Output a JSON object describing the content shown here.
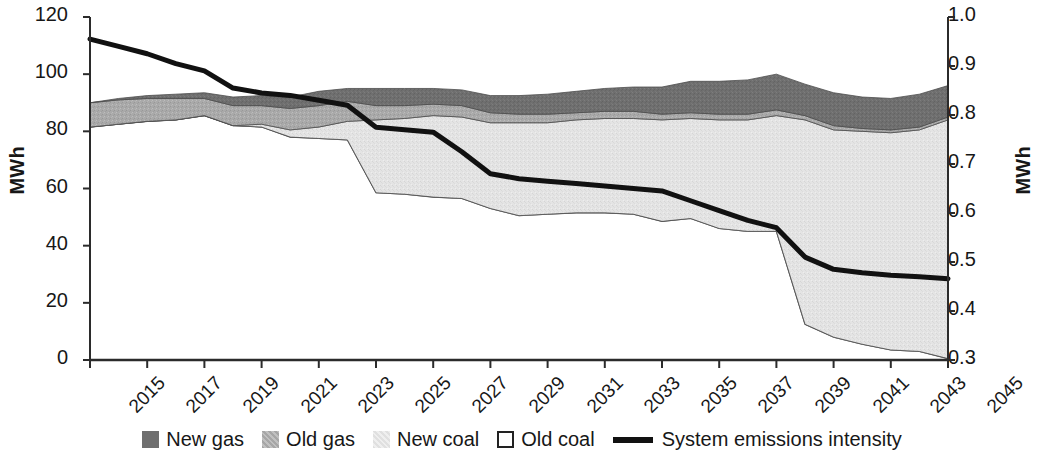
{
  "axes": {
    "left": {
      "label": "MWh",
      "ticks": [
        "0",
        "20",
        "40",
        "60",
        "80",
        "100",
        "120"
      ],
      "min": 0,
      "max": 120
    },
    "right": {
      "label": "MWh",
      "ticks": [
        "0.3",
        "0.4",
        "0.5",
        "0.6",
        "0.7",
        "0.8",
        "0.9",
        "1.0"
      ],
      "min": 0.3,
      "max": 1.0
    },
    "x": {
      "ticks": [
        "2015",
        "2017",
        "2019",
        "2021",
        "2023",
        "2025",
        "2027",
        "2029",
        "2031",
        "2033",
        "2035",
        "2037",
        "2039",
        "2041",
        "2043",
        "2045"
      ],
      "min": 2015,
      "max": 2045
    }
  },
  "legend": {
    "items": [
      {
        "label": "New gas",
        "swatch": "filled",
        "color": "#6f6f6f"
      },
      {
        "label": "Old gas",
        "swatch": "filled",
        "color": "#a8a8a8"
      },
      {
        "label": "New coal",
        "swatch": "filled",
        "color": "#e2e2e2"
      },
      {
        "label": "Old coal",
        "swatch": "outline",
        "color": "#ffffff"
      },
      {
        "label": "System emissions intensity",
        "swatch": "line",
        "color": "#111111"
      }
    ]
  },
  "chart_data": {
    "type": "area",
    "title": "",
    "xlabel": "",
    "ylabel": "MWh",
    "y2label": "MWh",
    "ylim": [
      0,
      120
    ],
    "y2lim": [
      0.3,
      1.0
    ],
    "grid": false,
    "legend_position": "bottom",
    "stacked": true,
    "stack_order": [
      "Old coal",
      "New coal",
      "Old gas",
      "New gas"
    ],
    "x": [
      2015,
      2016,
      2017,
      2018,
      2019,
      2020,
      2021,
      2022,
      2023,
      2024,
      2025,
      2026,
      2027,
      2028,
      2029,
      2030,
      2031,
      2032,
      2033,
      2034,
      2035,
      2036,
      2037,
      2038,
      2039,
      2040,
      2041,
      2042,
      2043,
      2044,
      2045
    ],
    "series": [
      {
        "name": "Old coal",
        "axis": "left",
        "color": "#ffffff",
        "values": [
          81.5,
          82.5,
          83.5,
          84.0,
          85.5,
          82.0,
          81.5,
          78.0,
          77.5,
          77.0,
          58.5,
          58.0,
          57.0,
          56.5,
          53.0,
          50.5,
          51.0,
          51.5,
          51.5,
          51.0,
          48.5,
          49.5,
          46.0,
          45.0,
          45.0,
          12.5,
          8.0,
          5.5,
          3.5,
          3.0,
          0.5
        ]
      },
      {
        "name": "New coal",
        "axis": "left",
        "color": "#e3e3e3",
        "values": [
          0.0,
          0.0,
          0.0,
          0.0,
          0.0,
          0.0,
          1.0,
          2.5,
          4.0,
          6.5,
          25.5,
          26.5,
          28.5,
          28.5,
          30.0,
          32.5,
          32.0,
          32.5,
          33.0,
          33.5,
          35.5,
          35.0,
          38.0,
          39.0,
          40.5,
          71.5,
          72.5,
          74.5,
          76.0,
          77.5,
          83.5
        ]
      },
      {
        "name": "Old gas",
        "axis": "left",
        "color": "#aaaaaa",
        "values": [
          8.5,
          8.5,
          8.0,
          7.5,
          6.0,
          7.0,
          6.5,
          7.5,
          7.5,
          7.0,
          5.0,
          4.5,
          4.0,
          4.0,
          3.5,
          3.0,
          3.0,
          2.5,
          2.5,
          2.5,
          2.0,
          2.0,
          2.0,
          2.0,
          2.0,
          1.5,
          1.5,
          1.0,
          1.0,
          1.0,
          1.0
        ]
      },
      {
        "name": "New gas",
        "axis": "left",
        "color": "#6e6e6e",
        "values": [
          0.0,
          0.5,
          1.0,
          1.5,
          2.0,
          3.0,
          3.5,
          4.0,
          5.0,
          4.5,
          6.0,
          6.0,
          5.5,
          5.5,
          6.0,
          6.5,
          7.0,
          7.5,
          8.0,
          8.5,
          9.5,
          11.0,
          11.5,
          12.0,
          12.5,
          11.0,
          11.5,
          11.0,
          11.0,
          11.5,
          11.0
        ]
      },
      {
        "name": "System emissions intensity",
        "axis": "right",
        "color": "#111111",
        "values": [
          0.955,
          0.94,
          0.925,
          0.905,
          0.89,
          0.855,
          0.845,
          0.84,
          0.83,
          0.82,
          0.775,
          0.77,
          0.765,
          0.725,
          0.68,
          0.67,
          0.665,
          0.66,
          0.655,
          0.65,
          0.645,
          0.625,
          0.605,
          0.585,
          0.57,
          0.51,
          0.485,
          0.478,
          0.473,
          0.47,
          0.466
        ]
      }
    ]
  }
}
